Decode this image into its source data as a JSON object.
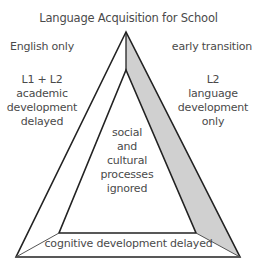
{
  "title": "Language Acquisition for School",
  "corners": {
    "left": "English only",
    "right": "early transition"
  },
  "regions": {
    "left_side": [
      "L1 + L2",
      "academic",
      "development",
      "delayed"
    ],
    "right_side": [
      "L2",
      "language",
      "development",
      "only"
    ],
    "center": [
      "social",
      "and",
      "cultural",
      "processes",
      "ignored"
    ],
    "bottom": "cognitive development delayed"
  },
  "colors": {
    "stroke": "#222222",
    "shaded_band": "#d0d0d0",
    "text": "#4a4a4a",
    "background": "#ffffff"
  }
}
